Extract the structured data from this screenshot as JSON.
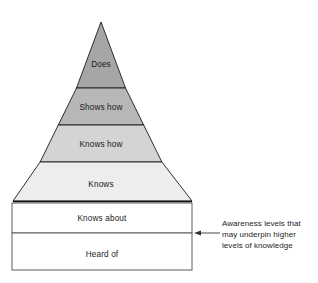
{
  "figure": {
    "background_color": "#ffffff",
    "outline_color": "#1a1a1a",
    "text_color": "#1a1a1a"
  },
  "pyramid": {
    "name": "competence-pyramid",
    "apex": {
      "x": 101,
      "y": 22
    },
    "base_left": {
      "x": 13,
      "y": 201
    },
    "base_right": {
      "x": 192,
      "y": 201
    },
    "tiers": [
      {
        "label": "Does",
        "fill": "#a6a6a6",
        "y_top": 22,
        "y_bottom": 88,
        "label_y": 64
      },
      {
        "label": "Shows how",
        "fill": "#b7b7b7",
        "y_top": 88,
        "y_bottom": 125,
        "label_y": 110
      },
      {
        "label": "Knows how",
        "fill": "#d4d4d4",
        "y_top": 125,
        "y_bottom": 162,
        "label_y": 147
      },
      {
        "label": "Knows",
        "fill": "#ededed",
        "y_top": 162,
        "y_bottom": 201,
        "label_y": 186
      }
    ]
  },
  "base_boxes": {
    "name": "awareness-base-boxes",
    "left": 12,
    "right": 192,
    "items": [
      {
        "label": "Knows about",
        "fill": "#ffffff",
        "y_top": 203,
        "y_bottom": 233,
        "label_y": 221
      },
      {
        "label": "Heard of",
        "fill": "#ffffff",
        "y_top": 233,
        "y_bottom": 270,
        "label_y": 256
      }
    ]
  },
  "annotation": {
    "name": "awareness-annotation",
    "arrow": {
      "x_tail": 220,
      "x_head": 195,
      "y": 233
    },
    "text_x": 222,
    "lines": [
      {
        "text": "Awareness levels that",
        "y": 225
      },
      {
        "text": "may underpin higher",
        "y": 236
      },
      {
        "text": "levels of knowledge",
        "y": 247
      }
    ]
  }
}
